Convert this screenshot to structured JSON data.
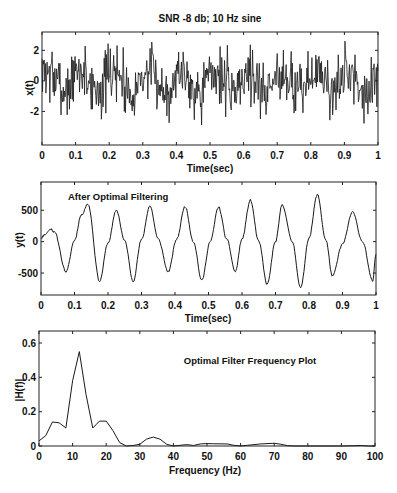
{
  "figure": {
    "background": "#ffffff",
    "line_color": "#1a1a1a"
  },
  "chart_data": [
    {
      "type": "line",
      "id": "noisy-input",
      "title": "SNR -8 db; 10 Hz sine",
      "xlabel": "Time(sec)",
      "ylabel": "x(t)",
      "annotation": "",
      "xlim": [
        0,
        1
      ],
      "ylim": [
        -4.2,
        3.2
      ],
      "xticks": [
        0,
        0.1,
        0.2,
        0.3,
        0.4,
        0.5,
        0.6,
        0.7,
        0.8,
        0.9,
        1
      ],
      "xtick_labels": [
        "0",
        "0.1",
        "0.2",
        "0.3",
        "0.4",
        "0.5",
        "0.6",
        "0.7",
        "0.8",
        "0.9",
        "1"
      ],
      "yticks": [
        -2,
        0,
        2
      ],
      "ytick_labels": [
        "-2",
        "0",
        "2"
      ],
      "grid": false,
      "box": {
        "left": 42,
        "top": 32,
        "right": 378,
        "bottom": 145
      },
      "signal": {
        "description": "10 Hz sine of amplitude ~0.6 buried in white noise (std ~1), sampled ~1000 Hz",
        "freq_hz": 10,
        "amplitude": 0.6,
        "noise_std": 0.95,
        "samples": 600,
        "seed": 7
      }
    },
    {
      "type": "line",
      "id": "filtered-output",
      "title": "",
      "xlabel": "Time(sec)",
      "ylabel": "y(t)",
      "annotation": "After Optimal Filtering",
      "xlim": [
        0,
        1
      ],
      "ylim": [
        -850,
        950
      ],
      "xticks": [
        0,
        0.1,
        0.2,
        0.3,
        0.4,
        0.5,
        0.6,
        0.7,
        0.8,
        0.9,
        1
      ],
      "xtick_labels": [
        "0",
        "0.1",
        "0.2",
        "0.3",
        "0.4",
        "0.5",
        "0.6",
        "0.7",
        "0.8",
        "0.9",
        "1"
      ],
      "yticks": [
        -500,
        0,
        500
      ],
      "ytick_labels": [
        "-500",
        "0",
        "500"
      ],
      "grid": false,
      "box": {
        "left": 41,
        "top": 182,
        "right": 376,
        "bottom": 295
      },
      "x": [
        0,
        0.01,
        0.03,
        0.04,
        0.075,
        0.1,
        0.12,
        0.14,
        0.175,
        0.2,
        0.225,
        0.25,
        0.275,
        0.3,
        0.325,
        0.35,
        0.38,
        0.405,
        0.43,
        0.455,
        0.48,
        0.505,
        0.53,
        0.555,
        0.58,
        0.6,
        0.625,
        0.65,
        0.675,
        0.7,
        0.72,
        0.75,
        0.775,
        0.8,
        0.825,
        0.85,
        0.87,
        0.9,
        0.93,
        0.96,
        0.99,
        1.0
      ],
      "y": [
        50,
        110,
        200,
        150,
        -480,
        20,
        420,
        600,
        -630,
        -20,
        500,
        10,
        -630,
        30,
        570,
        40,
        -480,
        40,
        560,
        0,
        -620,
        0,
        550,
        30,
        -480,
        40,
        660,
        0,
        -680,
        0,
        590,
        0,
        -740,
        60,
        750,
        30,
        -550,
        -40,
        470,
        0,
        -630,
        -200
      ]
    },
    {
      "type": "line",
      "id": "filter-frequency",
      "title": "",
      "xlabel": "Frequency (Hz)",
      "ylabel": "|H(f)|",
      "annotation": "Optimal Filter Frequency Plot",
      "xlim": [
        0,
        100
      ],
      "ylim": [
        0,
        0.67
      ],
      "xticks": [
        0,
        10,
        20,
        30,
        40,
        50,
        60,
        70,
        80,
        90,
        100
      ],
      "xtick_labels": [
        "0",
        "10",
        "20",
        "30",
        "40",
        "50",
        "60",
        "70",
        "80",
        "90",
        "100"
      ],
      "yticks": [
        0,
        0.2,
        0.4,
        0.6
      ],
      "ytick_labels": [
        "0",
        "0.2",
        "0.4",
        "0.6"
      ],
      "grid": false,
      "box": {
        "left": 39,
        "top": 331,
        "right": 375,
        "bottom": 446
      },
      "x": [
        0,
        2,
        4,
        6,
        8,
        10,
        12,
        14,
        16,
        18,
        20,
        22,
        24,
        26,
        28,
        30,
        32,
        34,
        36,
        38,
        40,
        42,
        44,
        46,
        48,
        50,
        52,
        56,
        58,
        60,
        62,
        66,
        70,
        72,
        74,
        76,
        80,
        90,
        94,
        96,
        98,
        100
      ],
      "y": [
        0.03,
        0.06,
        0.14,
        0.135,
        0.105,
        0.38,
        0.55,
        0.3,
        0.105,
        0.145,
        0.145,
        0.09,
        0.02,
        0.0,
        0.003,
        0.01,
        0.04,
        0.052,
        0.04,
        0.01,
        0.0,
        0.004,
        0.008,
        0.003,
        0.012,
        0.014,
        0.013,
        0.012,
        0.004,
        0.0,
        0.004,
        0.012,
        0.016,
        0.01,
        0.002,
        0.0,
        0.0,
        0.0,
        0.002,
        0.003,
        0.0,
        0.0
      ]
    }
  ]
}
